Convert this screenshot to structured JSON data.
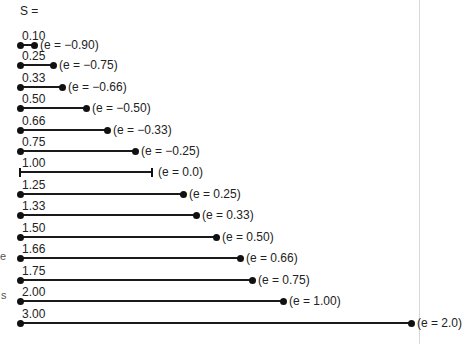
{
  "chart_data": {
    "type": "diagram",
    "title": "",
    "header_label": "S =",
    "items": [
      {
        "s": "0.10",
        "e": "(e = −0.90)",
        "end_style": "dot",
        "length_px": 14
      },
      {
        "s": "0.25",
        "e": "(e = −0.75)",
        "end_style": "dot",
        "length_px": 33
      },
      {
        "s": "0.33",
        "e": "(e = −0.66)",
        "end_style": "dot",
        "length_px": 42
      },
      {
        "s": "0.50",
        "e": "(e = −0.50)",
        "end_style": "dot",
        "length_px": 66
      },
      {
        "s": "0.66",
        "e": "(e = −0.33)",
        "end_style": "dot",
        "length_px": 87
      },
      {
        "s": "0.75",
        "e": "(e = −0.25)",
        "end_style": "dot",
        "length_px": 115
      },
      {
        "s": "1.00",
        "e": "(e = 0.0)",
        "end_style": "tick",
        "length_px": 132
      },
      {
        "s": "1.25",
        "e": "(e = 0.25)",
        "end_style": "dot",
        "length_px": 163
      },
      {
        "s": "1.33",
        "e": "(e = 0.33)",
        "end_style": "dot",
        "length_px": 176
      },
      {
        "s": "1.50",
        "e": "(e = 0.50)",
        "end_style": "dot",
        "length_px": 196
      },
      {
        "s": "1.66",
        "e": "(e = 0.66)",
        "end_style": "dot",
        "length_px": 220
      },
      {
        "s": "1.75",
        "e": "(e = 0.75)",
        "end_style": "dot",
        "length_px": 232
      },
      {
        "s": "2.00",
        "e": "(e = 1.00)",
        "end_style": "dot",
        "length_px": 263
      },
      {
        "s": "3.00",
        "e": "(e = 2.0)",
        "end_style": "dot",
        "length_px": 391
      }
    ]
  },
  "edge_glyphs": [
    "e",
    "s"
  ]
}
